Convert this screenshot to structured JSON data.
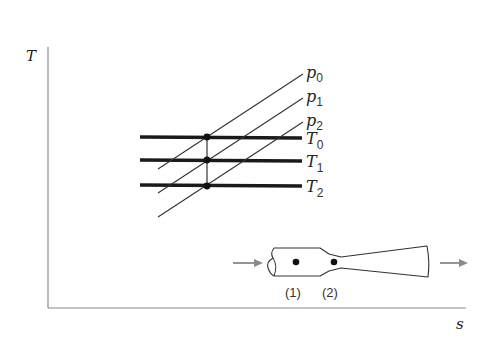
{
  "diagram": {
    "axes": {
      "y_label": "T",
      "x_label": "s"
    },
    "isobars": [
      {
        "label": "p",
        "sub": "0"
      },
      {
        "label": "p",
        "sub": "1"
      },
      {
        "label": "p",
        "sub": "2"
      }
    ],
    "isotherms": [
      {
        "label": "T",
        "sub": "0"
      },
      {
        "label": "T",
        "sub": "1"
      },
      {
        "label": "T",
        "sub": "2"
      }
    ],
    "nozzle": {
      "stations": [
        {
          "label": "(1)"
        },
        {
          "label": "(2)"
        }
      ]
    },
    "colors": {
      "line": "#333333",
      "thick_line": "#1a1a1a",
      "axis": "#888888",
      "arrow": "#888888"
    }
  }
}
